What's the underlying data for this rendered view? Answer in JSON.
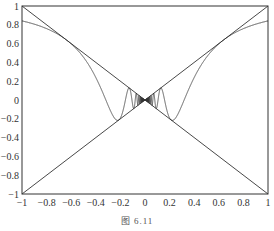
{
  "chart_data": {
    "type": "line",
    "title": "",
    "caption": "图 6.11",
    "xlabel": "",
    "ylabel": "",
    "xlim": [
      -1,
      1
    ],
    "ylim": [
      -1,
      1
    ],
    "grid": false,
    "legend": null,
    "x_ticks": [
      "-1",
      "-0.8",
      "-0.6",
      "-0.4",
      "-0.2",
      "0",
      "0.2",
      "0.4",
      "0.6",
      "0.8",
      "1"
    ],
    "y_ticks": [
      "-1",
      "-0.8",
      "-0.6",
      "-0.4",
      "-0.2",
      "0",
      "0.2",
      "0.4",
      "0.6",
      "0.8",
      "1"
    ],
    "series": [
      {
        "name": "y = x",
        "x": [
          -1,
          1
        ],
        "y": [
          -1,
          1
        ]
      },
      {
        "name": "y = -x",
        "x": [
          -1,
          1
        ],
        "y": [
          1,
          -1
        ]
      },
      {
        "name": "y = x·sin(1/x)",
        "x": [
          -1,
          -0.8,
          -0.6,
          -0.4,
          -0.3,
          -0.2,
          -0.1,
          0.1,
          0.2,
          0.3,
          0.4,
          0.6,
          0.8,
          1
        ],
        "y": [
          0.841,
          0.759,
          0.597,
          0.239,
          -0.055,
          -0.192,
          0.054,
          0.054,
          -0.192,
          -0.055,
          0.239,
          0.597,
          0.759,
          0.841
        ]
      }
    ],
    "color": "#333333"
  },
  "caption": "图 6.11"
}
